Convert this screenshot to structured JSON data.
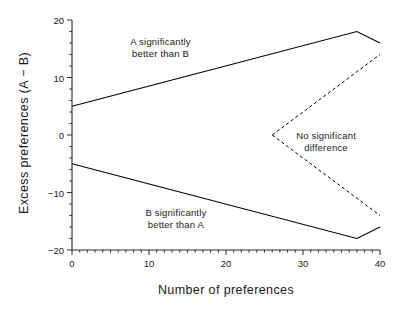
{
  "chart_data": {
    "type": "line",
    "title": "",
    "xlabel": "Number of preferences",
    "ylabel": "Excess preferences (A − B)",
    "xlim": [
      0,
      40
    ],
    "ylim": [
      -20,
      20
    ],
    "grid": false,
    "legend": "none",
    "x_ticks": [
      {
        "value": 0,
        "label": "0"
      },
      {
        "value": 10,
        "label": "10"
      },
      {
        "value": 20,
        "label": "20"
      },
      {
        "value": 30,
        "label": "30"
      },
      {
        "value": 40,
        "label": "40"
      }
    ],
    "x_minor_tick_step": 1,
    "y_ticks": [
      {
        "value": 20,
        "label": "20"
      },
      {
        "value": 10,
        "label": "10"
      },
      {
        "value": 0,
        "label": "0"
      },
      {
        "value": -10,
        "label": "−10"
      },
      {
        "value": -20,
        "label": "−20"
      }
    ],
    "y_minor_tick_step": 2,
    "spines": {
      "left": true,
      "bottom": true,
      "top": false,
      "right": false
    },
    "series": [
      {
        "name": "Upper significance boundary (A better than B)",
        "style": "solid",
        "color": "#000000",
        "points": [
          {
            "x": 0,
            "y": 5
          },
          {
            "x": 37,
            "y": 18
          },
          {
            "x": 40,
            "y": 16
          }
        ]
      },
      {
        "name": "Lower significance boundary (B better than A)",
        "style": "solid",
        "color": "#000000",
        "points": [
          {
            "x": 0,
            "y": -5
          },
          {
            "x": 37,
            "y": -18
          },
          {
            "x": 40,
            "y": -16
          }
        ]
      },
      {
        "name": "Upper non-significance boundary",
        "style": "dashed",
        "color": "#000000",
        "points": [
          {
            "x": 26,
            "y": 0
          },
          {
            "x": 40,
            "y": 14
          }
        ]
      },
      {
        "name": "Lower non-significance boundary",
        "style": "dashed",
        "color": "#000000",
        "points": [
          {
            "x": 26,
            "y": 0
          },
          {
            "x": 40,
            "y": -14
          }
        ]
      }
    ],
    "annotations": [
      {
        "name": "region-a-better",
        "lines": [
          "A significantly",
          "better than B"
        ],
        "x": 11.5,
        "y": 15.2
      },
      {
        "name": "region-b-better",
        "lines": [
          "B significantly",
          "better than A"
        ],
        "x": 13.5,
        "y": -14.6
      },
      {
        "name": "region-no-difference",
        "lines": [
          "No significant",
          "difference"
        ],
        "x": 33.0,
        "y": -1.2
      }
    ]
  },
  "annotation_text": {
    "a_better_line1": "A significantly",
    "a_better_line2": "better than B",
    "b_better_line1": "B significantly",
    "b_better_line2": "better than A",
    "no_diff_line1": "No significant",
    "no_diff_line2": "difference"
  },
  "axes": {
    "x_title": "Number of preferences",
    "y_title": "Excess preferences (A − B)"
  },
  "tick_labels": {
    "x": [
      "0",
      "10",
      "20",
      "30",
      "40"
    ],
    "y": [
      "20",
      "10",
      "0",
      "−10",
      "−20"
    ]
  },
  "colors": {
    "line": "#000000",
    "axis": "#2b2b2b",
    "text": "#1a1a1a",
    "background": "#ffffff"
  }
}
